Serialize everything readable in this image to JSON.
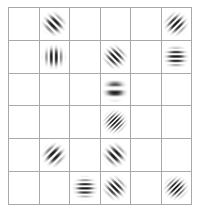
{
  "stimulus": {
    "type": "gabor-patch-grid",
    "title": "Gabor patch grid stimulus",
    "background_color": "#ffffff",
    "grid_line_color": "#a9a9a9",
    "patch_color": "#1a1a1a",
    "columns": 6,
    "rows": 6,
    "patch_diameter_px": 26,
    "total_patches": 12,
    "empty_cells": 24,
    "orientation_legend": {
      "vertical": "0 deg",
      "diagonal-right": "45 deg",
      "horizontal": "90 deg",
      "diagonal-left": "135 deg"
    },
    "cells": [
      {
        "row": 1,
        "col": 1,
        "patch": null
      },
      {
        "row": 1,
        "col": 2,
        "patch": {
          "orientation_deg": 135,
          "orientation_name": "diagonal-left",
          "frequency": "medium",
          "cycles": 4,
          "band_px": 3.6
        }
      },
      {
        "row": 1,
        "col": 3,
        "patch": null
      },
      {
        "row": 1,
        "col": 4,
        "patch": null
      },
      {
        "row": 1,
        "col": 5,
        "patch": null
      },
      {
        "row": 1,
        "col": 6,
        "patch": {
          "orientation_deg": 45,
          "orientation_name": "diagonal-right",
          "frequency": "medium-high",
          "cycles": 5,
          "band_px": 3.0
        }
      },
      {
        "row": 2,
        "col": 1,
        "patch": null
      },
      {
        "row": 2,
        "col": 2,
        "patch": {
          "orientation_deg": 0,
          "orientation_name": "vertical",
          "frequency": "medium",
          "cycles": 4,
          "band_px": 3.4
        }
      },
      {
        "row": 2,
        "col": 3,
        "patch": null
      },
      {
        "row": 2,
        "col": 4,
        "patch": {
          "orientation_deg": 135,
          "orientation_name": "diagonal-left",
          "frequency": "medium-high",
          "cycles": 5,
          "band_px": 3.0
        }
      },
      {
        "row": 2,
        "col": 5,
        "patch": null
      },
      {
        "row": 2,
        "col": 6,
        "patch": {
          "orientation_deg": 90,
          "orientation_name": "horizontal",
          "frequency": "medium-high",
          "cycles": 5,
          "band_px": 3.0
        }
      },
      {
        "row": 3,
        "col": 1,
        "patch": null
      },
      {
        "row": 3,
        "col": 2,
        "patch": null
      },
      {
        "row": 3,
        "col": 3,
        "patch": null
      },
      {
        "row": 3,
        "col": 4,
        "patch": {
          "orientation_deg": 90,
          "orientation_name": "horizontal",
          "frequency": "low",
          "cycles": 2,
          "band_px": 6.5
        }
      },
      {
        "row": 3,
        "col": 5,
        "patch": null
      },
      {
        "row": 3,
        "col": 6,
        "patch": null
      },
      {
        "row": 4,
        "col": 1,
        "patch": null
      },
      {
        "row": 4,
        "col": 2,
        "patch": null
      },
      {
        "row": 4,
        "col": 3,
        "patch": null
      },
      {
        "row": 4,
        "col": 4,
        "patch": {
          "orientation_deg": 45,
          "orientation_name": "diagonal-right",
          "frequency": "high",
          "cycles": 7,
          "band_px": 2.1
        }
      },
      {
        "row": 4,
        "col": 5,
        "patch": null
      },
      {
        "row": 4,
        "col": 6,
        "patch": null
      },
      {
        "row": 5,
        "col": 1,
        "patch": null
      },
      {
        "row": 5,
        "col": 2,
        "patch": {
          "orientation_deg": 45,
          "orientation_name": "diagonal-right",
          "frequency": "medium",
          "cycles": 4,
          "band_px": 3.6
        }
      },
      {
        "row": 5,
        "col": 3,
        "patch": null
      },
      {
        "row": 5,
        "col": 4,
        "patch": {
          "orientation_deg": 135,
          "orientation_name": "diagonal-left",
          "frequency": "medium",
          "cycles": 4,
          "band_px": 3.6
        }
      },
      {
        "row": 5,
        "col": 5,
        "patch": null
      },
      {
        "row": 5,
        "col": 6,
        "patch": null
      },
      {
        "row": 6,
        "col": 1,
        "patch": null
      },
      {
        "row": 6,
        "col": 2,
        "patch": null
      },
      {
        "row": 6,
        "col": 3,
        "patch": {
          "orientation_deg": 90,
          "orientation_name": "horizontal",
          "frequency": "medium-high",
          "cycles": 5,
          "band_px": 2.8
        }
      },
      {
        "row": 6,
        "col": 4,
        "patch": {
          "orientation_deg": 135,
          "orientation_name": "diagonal-left",
          "frequency": "medium-high",
          "cycles": 5,
          "band_px": 3.0
        }
      },
      {
        "row": 6,
        "col": 5,
        "patch": null
      },
      {
        "row": 6,
        "col": 6,
        "patch": {
          "orientation_deg": 45,
          "orientation_name": "diagonal-right",
          "frequency": "high",
          "cycles": 6,
          "band_px": 2.4
        }
      }
    ]
  }
}
